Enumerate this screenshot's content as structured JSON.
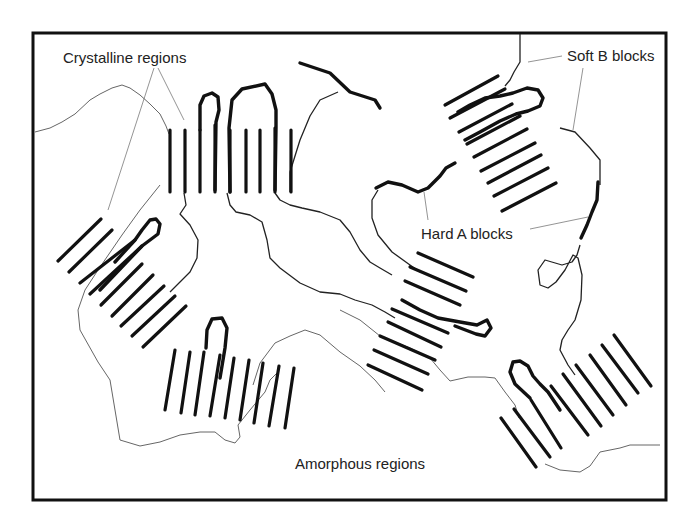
{
  "figure": {
    "labels": {
      "crystalline": "Crystalline regions",
      "soft_b": "Soft B blocks",
      "hard_a": "Hard A blocks",
      "amorphous": "Amorphous regions"
    },
    "colors": {
      "background": "#ffffff",
      "stroke": "#111111",
      "leader": "#888888",
      "text": "#222222"
    },
    "crystalline_domains": [
      {
        "name": "top-vertical",
        "lamellae": 10,
        "orientation": "vertical"
      },
      {
        "name": "left-diagonal",
        "lamellae": 9,
        "orientation": "diagonal-up-right"
      },
      {
        "name": "bottom-left-vertical",
        "lamellae": 9,
        "orientation": "near-vertical"
      },
      {
        "name": "top-right-diagonal",
        "lamellae": 9,
        "orientation": "diagonal-up-right"
      },
      {
        "name": "center-right-diagonal",
        "lamellae": 8,
        "orientation": "diagonal-down-right"
      },
      {
        "name": "bottom-right-diagonal",
        "lamellae": 9,
        "orientation": "diagonal-down-right"
      }
    ]
  }
}
